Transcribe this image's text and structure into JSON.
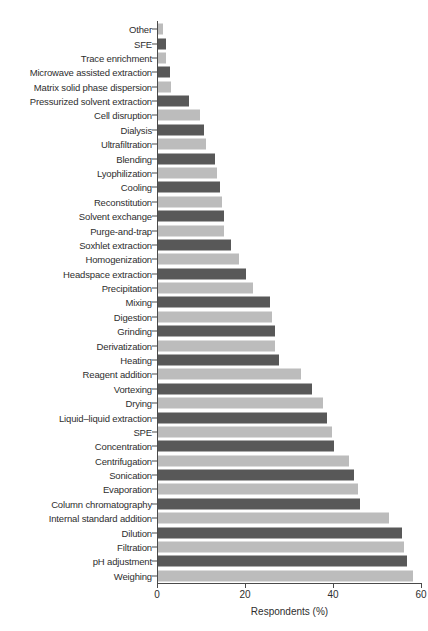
{
  "chart_data": {
    "type": "bar",
    "orientation": "horizontal",
    "title": "",
    "xlabel": "Respondents (%)",
    "ylabel": "",
    "xlim": [
      0,
      60
    ],
    "xticks": [
      0,
      20,
      40,
      60
    ],
    "xtick_labels": [
      "0",
      "20",
      "40",
      "60"
    ],
    "grid": false,
    "legend": null,
    "bar_colors": {
      "dark": "#585858",
      "light": "#bcbcbc",
      "pattern": "alternating light/dark from top"
    },
    "axis_color": "#4a4a4a",
    "categories": [
      "Other",
      "SFE",
      "Trace enrichment",
      "Microwave assisted extraction",
      "Matrix solid phase dispersion",
      "Pressurized solvent extraction",
      "Cell disruption",
      "Dialysis",
      "Ultrafiltration",
      "Blending",
      "Lyophilization",
      "Cooling",
      "Reconstitution",
      "Solvent exchange",
      "Purge-and-trap",
      "Soxhlet extraction",
      "Homogenization",
      "Headspace extraction",
      "Precipitation",
      "Mixing",
      "Digestion",
      "Grinding",
      "Derivatization",
      "Heating",
      "Reagent addition",
      "Vortexing",
      "Drying",
      "Liquid–liquid extraction",
      "SPE",
      "Concentration",
      "Centrifugation",
      "Sonication",
      "Evaporation",
      "Column chromatography",
      "Internal standard addition",
      "Dilution",
      "Filtration",
      "pH adjustment",
      "Weighing"
    ],
    "values": [
      1.2,
      1.8,
      1.8,
      2.8,
      3.0,
      7.0,
      9.5,
      10.5,
      11.0,
      13.0,
      13.5,
      14.0,
      14.5,
      15.0,
      15.0,
      16.5,
      18.5,
      20.0,
      21.5,
      25.5,
      26.0,
      26.5,
      26.5,
      27.5,
      32.5,
      35.0,
      37.5,
      38.5,
      39.5,
      40.0,
      43.5,
      44.5,
      45.5,
      46.0,
      52.5,
      55.5,
      56.0,
      56.5,
      58.0
    ]
  }
}
